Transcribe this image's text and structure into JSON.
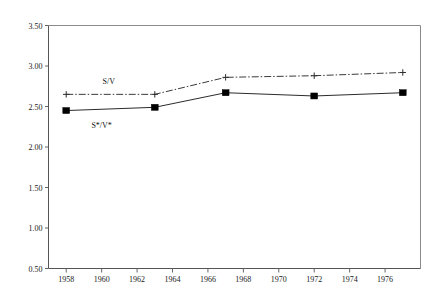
{
  "chart_data": {
    "type": "line",
    "title": "",
    "xlabel": "",
    "ylabel": "",
    "xlim": [
      1957,
      1978
    ],
    "ylim": [
      0.5,
      3.5
    ],
    "grid": false,
    "legend_position": "inline-annotation",
    "y_ticks": [
      "0.50",
      "1.00",
      "1.50",
      "2.00",
      "2.50",
      "3.00",
      "3.50"
    ],
    "y_tick_values": [
      0.5,
      1.0,
      1.5,
      2.0,
      2.5,
      3.0,
      3.5
    ],
    "x_ticks": [
      "1958",
      "1960",
      "1962",
      "1964",
      "1966",
      "1968",
      "1970",
      "1972",
      "1974",
      "1976"
    ],
    "x_tick_values": [
      1958,
      1960,
      1962,
      1964,
      1966,
      1968,
      1970,
      1972,
      1974,
      1976
    ],
    "x": [
      1958,
      1963,
      1967,
      1972,
      1977
    ],
    "series": [
      {
        "name": "S/V",
        "label": "S/V",
        "marker": "plus",
        "linestyle": "dash-dot",
        "color": "#3a3a3a",
        "values": [
          2.65,
          2.65,
          2.86,
          2.88,
          2.92
        ]
      },
      {
        "name": "S*/V*",
        "label": "S*/V*",
        "marker": "square",
        "linestyle": "solid",
        "color": "#2b2b2b",
        "values": [
          2.45,
          2.49,
          2.67,
          2.63,
          2.67
        ]
      }
    ],
    "annotations": [
      {
        "text": "S/V",
        "x": 1960.4,
        "y": 2.78
      },
      {
        "text": "S*/V*",
        "x": 1960.0,
        "y": 2.24
      }
    ]
  },
  "colors": {
    "background": "#ffffff",
    "axis": "#555555",
    "frame": "#8a8a8a",
    "text": "#1a1a1a",
    "series_solid": "#2b2b2b",
    "series_dashdot": "#3a3a3a"
  }
}
